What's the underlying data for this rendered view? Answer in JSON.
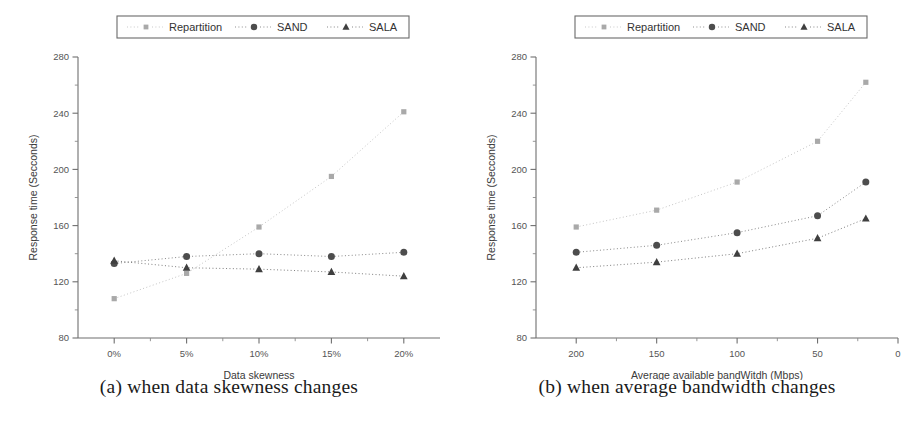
{
  "figure": {
    "subfigures": [
      {
        "id": "a",
        "caption": "(a) when data skewness changes",
        "chart_data": {
          "type": "scatter",
          "title": "",
          "xlabel": "Data skewness",
          "ylabel": "Response time (Secconds)",
          "categories": [
            "0%",
            "5%",
            "10%",
            "15%",
            "20%"
          ],
          "x": [
            0,
            5,
            10,
            15,
            20
          ],
          "xlim": [
            -2.5,
            22.5
          ],
          "xticks": [
            0,
            5,
            10,
            15,
            20
          ],
          "xticklabels": [
            "0%",
            "5%",
            "10%",
            "15%",
            "20%"
          ],
          "ylim": [
            80,
            280
          ],
          "yticks": [
            80,
            120,
            160,
            200,
            240,
            280
          ],
          "yticklabels": [
            "80",
            "120",
            "160",
            "200",
            "240",
            "280"
          ],
          "yminorticks": [
            100,
            140,
            180,
            220,
            260
          ],
          "grid": false,
          "legend_position": "top-center",
          "series": [
            {
              "name": "Repartition",
              "marker": "square",
              "color": "#a9a9a9",
              "values": [
                108,
                126,
                159,
                195,
                241
              ]
            },
            {
              "name": "SAND",
              "marker": "circle",
              "color": "#4d4d4d",
              "values": [
                133,
                138,
                140,
                138,
                141
              ]
            },
            {
              "name": "SALA",
              "marker": "triangle",
              "color": "#3f3f3f",
              "values": [
                135,
                130,
                129,
                127,
                124
              ]
            }
          ]
        }
      },
      {
        "id": "b",
        "caption": "(b) when average bandwidth changes",
        "chart_data": {
          "type": "scatter",
          "title": "",
          "xlabel": "Average available bandWitdh (Mbps)",
          "ylabel": "Response time (Secconds)",
          "categories": [
            "200",
            "150",
            "100",
            "50",
            "20"
          ],
          "x": [
            200,
            150,
            100,
            50,
            20
          ],
          "xlim": [
            225,
            0
          ],
          "xticks": [
            200,
            150,
            100,
            50,
            0
          ],
          "xticklabels": [
            "200",
            "150",
            "100",
            "50",
            "0"
          ],
          "ylim": [
            80,
            280
          ],
          "yticks": [
            80,
            120,
            160,
            200,
            240,
            280
          ],
          "yticklabels": [
            "80",
            "120",
            "160",
            "200",
            "240",
            "280"
          ],
          "yminorticks": [
            100,
            140,
            180,
            220,
            260
          ],
          "grid": false,
          "legend_position": "top-center",
          "series": [
            {
              "name": "Repartition",
              "marker": "square",
              "color": "#a9a9a9",
              "values": [
                159,
                171,
                191,
                220,
                262
              ]
            },
            {
              "name": "SAND",
              "marker": "circle",
              "color": "#4d4d4d",
              "values": [
                141,
                146,
                155,
                167,
                191
              ]
            },
            {
              "name": "SALA",
              "marker": "triangle",
              "color": "#3f3f3f",
              "values": [
                130,
                134,
                140,
                151,
                165
              ]
            }
          ]
        }
      }
    ],
    "legend_labels": [
      "Repartition",
      "SAND",
      "SALA"
    ],
    "colors": {
      "repartition": "#a9a9a9",
      "sand": "#4d4d4d",
      "sala": "#3f3f3f",
      "axis": "#6f6f6f",
      "text": "#333333",
      "background": "#ffffff"
    }
  }
}
